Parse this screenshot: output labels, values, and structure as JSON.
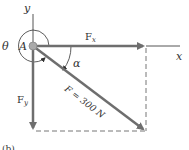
{
  "diagram": {
    "labels": {
      "y_axis": "y",
      "x_axis": "x",
      "point": "A",
      "theta": "θ",
      "alpha": "α",
      "fx": "F",
      "fx_sub": "x",
      "fy": "F",
      "fy_sub": "y",
      "force": "F = 300 N",
      "caption": "(b)"
    },
    "force_magnitude": "300 N",
    "colors": {
      "axis": "#555555",
      "arrow": "#6e6e6e",
      "dashed": "#777777",
      "point": "#999999",
      "text": "#333333"
    }
  }
}
